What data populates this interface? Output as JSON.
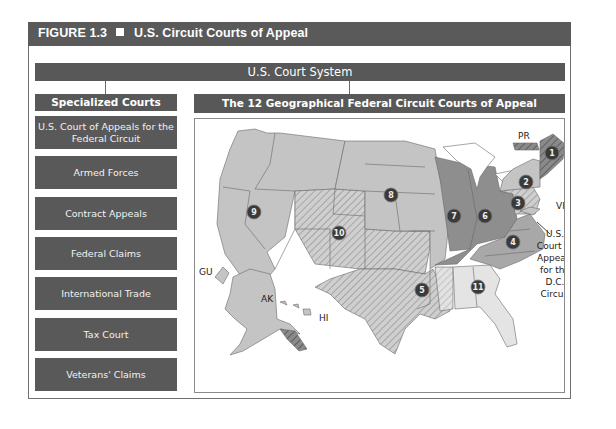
{
  "figure": {
    "label": "FIGURE 1.3",
    "title": "U.S. Circuit Courts of Appeal"
  },
  "system": {
    "title": "U.S. Court System"
  },
  "specialized": {
    "heading": "Specialized Courts",
    "items": [
      {
        "label": "U.S. Court of Appeals for the Federal Circuit"
      },
      {
        "label": "Armed Forces"
      },
      {
        "label": "Contract Appeals"
      },
      {
        "label": "Federal Claims"
      },
      {
        "label": "International Trade"
      },
      {
        "label": "Tax Court"
      },
      {
        "label": "Veterans' Claims"
      }
    ]
  },
  "geographical": {
    "heading": "The 12 Geographical Federal Circuit Courts of Appeal",
    "territory_labels": {
      "pr": "PR",
      "vi": "VI",
      "gu": "GU",
      "ak": "AK",
      "hi": "HI"
    },
    "circuits": [
      {
        "number": "1"
      },
      {
        "number": "2"
      },
      {
        "number": "3"
      },
      {
        "number": "4"
      },
      {
        "number": "5"
      },
      {
        "number": "6"
      },
      {
        "number": "7"
      },
      {
        "number": "8"
      },
      {
        "number": "9"
      },
      {
        "number": "10"
      },
      {
        "number": "11"
      }
    ],
    "dc_circuit_label": [
      "U.S.",
      "Court of",
      "Appeals",
      "for the",
      "D.C.",
      "Circuit"
    ]
  },
  "colors": {
    "header_bg": "#5a5a5a",
    "box_bg": "#595959",
    "map_light": "#c4c4c4",
    "map_dark": "#8e8e8e",
    "map_pale": "#e4e4e4",
    "marker": "#3a3a3a"
  }
}
